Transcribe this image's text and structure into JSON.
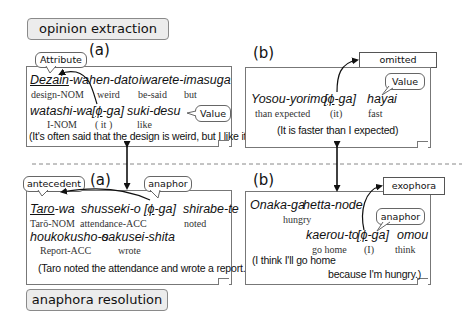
{
  "sections": {
    "top_label": "opinion extraction",
    "bottom_label": "anaphora resolution"
  },
  "panels": {
    "oe_a": {
      "label": "(a)",
      "callouts": {
        "attribute": "Attribute",
        "value": "Value"
      },
      "line1": {
        "w1_underlined": "Dezain",
        "w1_rest": "-wa",
        "w2": "hen-dato",
        "w3": "iwarete-imasuga"
      },
      "gloss1": {
        "g1": "design-NOM",
        "g2": "weird",
        "g3": "be-said",
        "g4": "but"
      },
      "line2": {
        "w1": "watashi-wa",
        "bracket_open": "[",
        "phi": "ϕ",
        "ga": "-ga]",
        "w3": "suki-desu"
      },
      "gloss2": {
        "g1": "I-NOM",
        "g2": "( it )",
        "g3": "like"
      },
      "translation": "(It's often said that the design is weird, but I like it.)"
    },
    "oe_b": {
      "label": "(b)",
      "callouts": {
        "omitted_attribute": "omitted Attribute",
        "value": "Value"
      },
      "line1": {
        "w1": "Yosou-yorimo",
        "bracket_open": "[",
        "phi": "ϕ",
        "ga": "-ga]",
        "w3": "hayai"
      },
      "gloss1": {
        "g1": "than expected",
        "g2": "(it)",
        "g3": "fast"
      },
      "translation": "(It is faster than I expected)"
    },
    "ar_a": {
      "label": "(a)",
      "callouts": {
        "antecedent": "antecedent",
        "anaphor": "anaphor"
      },
      "line1": {
        "w1_underlined": "Taro",
        "w1_rest": "-wa",
        "w2": "shusseki-o",
        "bracket_open": "[",
        "phi": "ϕ",
        "ga": "-ga]",
        "w4": "shirabe-te"
      },
      "gloss1": {
        "g1": "Tarō-NOM",
        "g2": "attendance-ACC",
        "g3": "noted"
      },
      "line2": {
        "w1": "houkokusho-o",
        "w2": "sakusei-shita"
      },
      "gloss2": {
        "g1": "Report-ACC",
        "g2": "wrote"
      },
      "translation": "(Taro noted the attendance and wrote a report.)"
    },
    "ar_b": {
      "label": "(b)",
      "callouts": {
        "exophora": "exophora",
        "anaphor": "anaphor"
      },
      "line1": {
        "w1": "Onaka-ga",
        "w2": "hetta-node"
      },
      "gloss1": {
        "g1": "hungry"
      },
      "line2": {
        "w1": "kaerou-to",
        "bracket_open": "[",
        "phi": "ϕ",
        "ga": "-ga]",
        "w3": "omou"
      },
      "gloss2": {
        "g1": "go home",
        "g2": "(I)",
        "g3": "think"
      },
      "translation_1": "(I think I'll go home",
      "translation_2": "because I'm hungry.)"
    }
  },
  "colors": {
    "border": "#777777",
    "tag_bg": "#ececec",
    "text": "#111111",
    "dash": "#888888"
  }
}
